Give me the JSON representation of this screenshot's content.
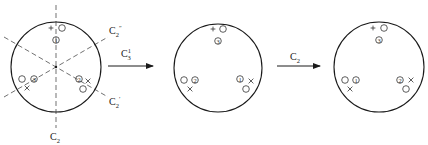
{
  "diagram": {
    "panels": [
      {
        "id": "initial",
        "center": [
          56,
          67
        ],
        "radius": 45,
        "axes": [
          {
            "name": "C2",
            "label": "C",
            "sub": "2",
            "prime": "",
            "x1": 56,
            "y1": 5,
            "x2": 56,
            "y2": 128,
            "lx": 50,
            "ly": 140
          },
          {
            "name": "C2''",
            "label": "C",
            "sub": "2",
            "prime": "″",
            "x1": 4,
            "y1": 97,
            "x2": 108,
            "y2": 37,
            "lx": 109,
            "ly": 34
          },
          {
            "name": "C2'",
            "label": "C",
            "sub": "2",
            "prime": "′",
            "x1": 4,
            "y1": 37,
            "x2": 108,
            "y2": 97,
            "lx": 109,
            "ly": 105
          }
        ],
        "groups": [
          {
            "num": "①",
            "numPos": [
              56,
              40
            ],
            "circle": [
              62,
              28
            ],
            "mark": "+",
            "markPos": [
              51,
              28
            ]
          },
          {
            "num": "③",
            "numPos": [
              34,
              79
            ],
            "circle": [
              22,
              79
            ],
            "mark": "×",
            "markPos": [
              27,
              88
            ]
          },
          {
            "num": "②",
            "numPos": [
              79,
              79
            ],
            "circle": [
              83,
              89
            ],
            "mark": "×",
            "markPos": [
              88,
              81
            ]
          }
        ]
      },
      {
        "id": "after-C3",
        "center": [
          218,
          68
        ],
        "radius": 44,
        "axes": [],
        "groups": [
          {
            "num": "③",
            "numPos": [
              218,
              41
            ],
            "circle": [
              223,
              29
            ],
            "mark": "+",
            "markPos": [
              213,
              29
            ]
          },
          {
            "num": "②",
            "numPos": [
              195,
              80
            ],
            "circle": [
              184,
              80
            ],
            "mark": "×",
            "markPos": [
              190,
              89
            ]
          },
          {
            "num": "①",
            "numPos": [
              240,
              79
            ],
            "circle": [
              246,
              89
            ],
            "mark": "×",
            "markPos": [
              251,
              81
            ]
          }
        ]
      },
      {
        "id": "after-C2",
        "center": [
          379,
          67
        ],
        "radius": 45,
        "axes": [],
        "groups": [
          {
            "num": "③",
            "numPos": [
              379,
              40
            ],
            "circle": [
              384,
              28
            ],
            "mark": "+",
            "markPos": [
              373,
              28
            ]
          },
          {
            "num": "①",
            "numPos": [
              356,
              80
            ],
            "circle": [
              345,
              80
            ],
            "mark": "×",
            "markPos": [
              350,
              89
            ]
          },
          {
            "num": "②",
            "numPos": [
              400,
              80
            ],
            "circle": [
              406,
              89
            ],
            "mark": "×",
            "markPos": [
              411,
              80
            ]
          }
        ]
      }
    ],
    "arrows": [
      {
        "label": "C",
        "sub": "3",
        "sup": "1",
        "x1": 108,
        "x2": 153,
        "y": 66,
        "lx": 121,
        "ly": 57
      },
      {
        "label": "C",
        "sub": "2",
        "sup": "",
        "x1": 277,
        "x2": 320,
        "y": 66,
        "lx": 290,
        "ly": 60
      }
    ]
  }
}
